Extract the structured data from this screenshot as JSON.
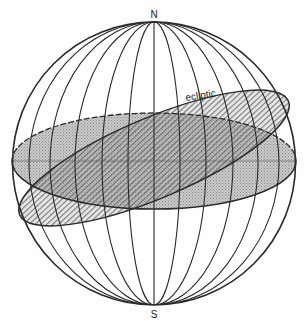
{
  "diagram": {
    "labels": {
      "north_pole": "N",
      "south_pole": "S",
      "ecliptic": "ecliptic"
    },
    "colors": {
      "line": "#2a2a2a",
      "equator_fill": "#bdbdbd",
      "ecliptic_hatch": "#3a3a3a",
      "background": "#ffffff"
    },
    "elements": [
      {
        "name": "sphere-outline",
        "type": "circle"
      },
      {
        "name": "meridians",
        "count": 11
      },
      {
        "name": "celestial-equator-plane",
        "fill": "stippled gray"
      },
      {
        "name": "ecliptic-plane",
        "fill": "diagonal hatching",
        "tilt_deg": 23.5
      }
    ]
  }
}
